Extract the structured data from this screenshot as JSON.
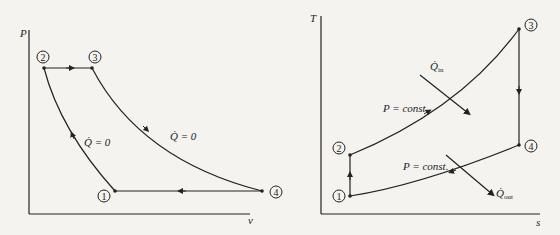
{
  "left_diagram": {
    "title": "P-v diagram",
    "x_axis_label": "v",
    "y_axis_label": "P",
    "states": [
      "1",
      "2",
      "3",
      "4"
    ],
    "process_labels": {
      "compression": "Q̇ = 0",
      "expansion": "Q̇ = 0"
    }
  },
  "right_diagram": {
    "title": "T-s diagram",
    "x_axis_label": "s",
    "y_axis_label": "T",
    "states": [
      "1",
      "2",
      "3",
      "4"
    ],
    "process_labels": {
      "heat_addition": "P = const.",
      "heat_rejection": "P = const.",
      "q_in": "Q̇",
      "q_in_sub": "in",
      "q_out": "Q̇",
      "q_out_sub": "out"
    }
  },
  "colors": {
    "line": "#222222",
    "background": "#f4f3ef"
  }
}
